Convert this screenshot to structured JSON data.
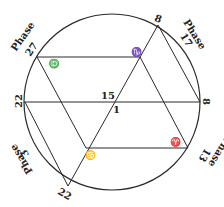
{
  "diagram": {
    "stroke_color": "#2a2a2a",
    "background": "#ffffff",
    "circle": {
      "cx": 112,
      "cy": 102,
      "r": 88
    },
    "points": {
      "p27": {
        "label": "27",
        "x": 37,
        "y": 57
      },
      "p8_top": {
        "label": "8",
        "x": 158,
        "y": 25
      },
      "p8_right": {
        "label": "8",
        "x": 200,
        "y": 102
      },
      "p22_left": {
        "label": "22",
        "x": 25,
        "y": 102
      },
      "p22_bottom": {
        "label": "22",
        "x": 68,
        "y": 186
      },
      "p13": {
        "x": 188,
        "y": 148
      }
    },
    "center_labels": {
      "upper": "15",
      "lower": "1"
    },
    "phase_labels": [
      {
        "word": "Phase",
        "number": "27",
        "position": "upper-left"
      },
      {
        "word": "Phase",
        "number": "17",
        "position": "upper-right"
      },
      {
        "word": "Phase",
        "number": "3",
        "position": "lower-left"
      },
      {
        "word": "Phase",
        "number": "13",
        "position": "lower-right"
      }
    ],
    "zodiac_symbols": [
      {
        "name": "capricorn",
        "glyph": "♑",
        "position": "upper-right-vertex"
      },
      {
        "name": "libra",
        "glyph": "♎",
        "position": "upper-left-vertex"
      },
      {
        "name": "cancer",
        "glyph": "♋",
        "position": "lower-left-vertex"
      },
      {
        "name": "aries",
        "glyph": "♈",
        "position": "lower-right-vertex"
      }
    ]
  }
}
